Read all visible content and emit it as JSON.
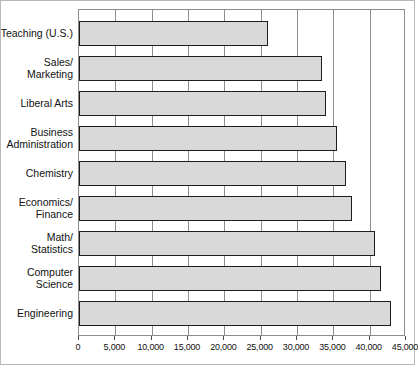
{
  "chart_data": {
    "type": "bar",
    "orientation": "horizontal",
    "title": "",
    "subtitle": "",
    "xlabel": "",
    "ylabel": "",
    "xlim": [
      0,
      45000
    ],
    "grid": true,
    "legend": false,
    "bar_fill_color": "#d9d9d9",
    "bar_border_color": "#1d1d1d",
    "axis_color": "#8d8d8d",
    "xticks": [
      0,
      5000,
      10000,
      15000,
      20000,
      25000,
      30000,
      35000,
      40000,
      45000
    ],
    "xtick_labels": [
      "0",
      "5,000",
      "10,000",
      "15,000",
      "20,000",
      "25,000",
      "30,000",
      "35,000",
      "40,000",
      "45,000"
    ],
    "categories": [
      "Teaching (U.S.)",
      "Sales/\nMarketing",
      "Liberal Arts",
      "Business\nAdministration",
      "Chemistry",
      "Economics/\nFinance",
      "Math/\nStatistics",
      "Computer\nScience",
      "Engineering"
    ],
    "values": [
      26000,
      33500,
      34000,
      35500,
      36800,
      37500,
      40800,
      41500,
      43000
    ]
  }
}
